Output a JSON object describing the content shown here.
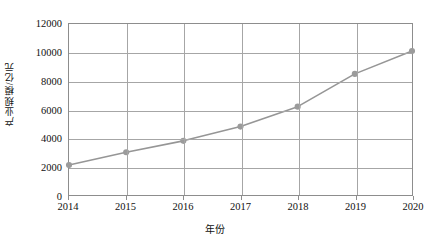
{
  "chart_data": {
    "type": "line",
    "title": "",
    "xlabel": "年份",
    "ylabel": "产业规模/亿元",
    "categories": [
      "2014",
      "2015",
      "2016",
      "2017",
      "2018",
      "2019",
      "2020"
    ],
    "values": [
      2100,
      3000,
      3800,
      4800,
      6200,
      8500,
      10100
    ],
    "series": [
      {
        "name": "产业规模",
        "values": [
          2100,
          3000,
          3800,
          4800,
          6200,
          8500,
          10100
        ]
      }
    ],
    "ylim": [
      0,
      12000
    ],
    "y_ticks": [
      "0",
      "2000",
      "4000",
      "6000",
      "8000",
      "10000",
      "12000"
    ],
    "y_tick_values": [
      0,
      2000,
      4000,
      6000,
      8000,
      10000,
      12000
    ],
    "x_ticks": [
      "2014",
      "2015",
      "2016",
      "2017",
      "2018",
      "2019",
      "2020"
    ],
    "grid": true,
    "legend": "none",
    "line_color": "#969696",
    "marker_color": "#9b9b9b",
    "frame_color": "#8d8d8d",
    "grid_color": "#a6a6a6"
  },
  "caption": ""
}
